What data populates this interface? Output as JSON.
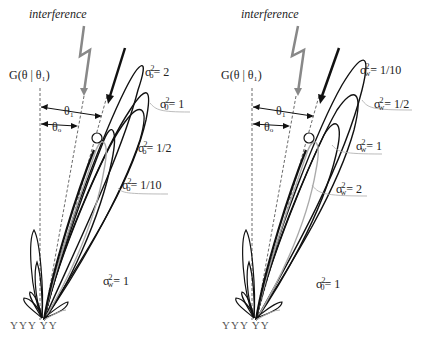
{
  "left": {
    "interference": "interference",
    "gain": "G(θ | θ₁)",
    "theta1": "θ₁",
    "theta0": "θₒ",
    "curves": [
      {
        "sym": "σ",
        "sub": "o",
        "sup": "2",
        "val": "= 2"
      },
      {
        "sym": "σ",
        "sub": "0",
        "sup": "2",
        "val": "= 1"
      },
      {
        "sym": "σ",
        "sub": "o",
        "sup": "2",
        "val": "= 1/2"
      },
      {
        "sym": "σ",
        "sub": "o",
        "sup": "2",
        "val": "= 1/10"
      }
    ],
    "fixed": {
      "sym": "σ",
      "sub": "w",
      "sup": "2",
      "val": "= 1"
    },
    "antennas": "YYY   YY"
  },
  "right": {
    "interference": "interference",
    "gain": "G(θ | θ₁)",
    "theta1": "θ₁",
    "theta0": "θₒ",
    "curves": [
      {
        "sym": "σ",
        "sub": "w",
        "sup": "2",
        "val": "= 1/10"
      },
      {
        "sym": "σ",
        "sub": "w",
        "sup": "2",
        "val": "= 1/2"
      },
      {
        "sym": "σ",
        "sub": "w",
        "sup": "2",
        "val": "= 1"
      },
      {
        "sym": "σ",
        "sub": "w",
        "sup": "2",
        "val": "= 2"
      }
    ],
    "fixed": {
      "sym": "σ",
      "sub": "0",
      "sup": "2",
      "val": "= 1"
    },
    "antennas": "YYY   YY"
  }
}
